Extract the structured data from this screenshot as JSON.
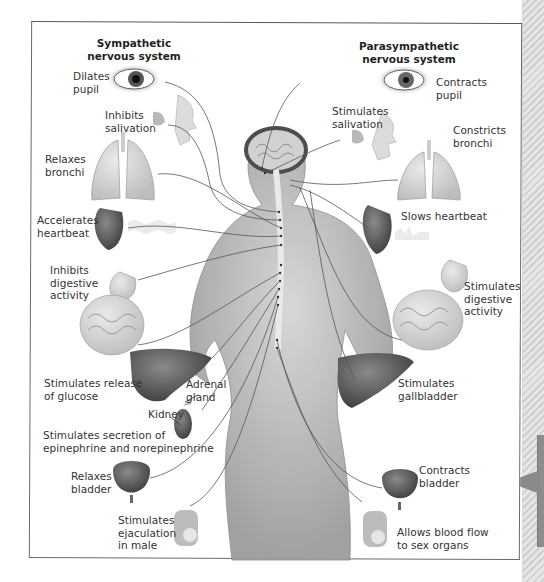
{
  "diagram": {
    "type": "autonomic-nervous-system-illustration",
    "headers": {
      "sympathetic": "Sympathetic\nnervous system",
      "parasympathetic": "Parasympathetic\nnervous system"
    },
    "sympathetic_effects": [
      {
        "organ": "eye",
        "label": "Dilates\npupil"
      },
      {
        "organ": "salivary-gland",
        "label": "Inhibits\nsalivation"
      },
      {
        "organ": "lungs",
        "label": "Relaxes\nbronchi"
      },
      {
        "organ": "heart",
        "label": "Accelerates\nheartbeat"
      },
      {
        "organ": "stomach-intestines",
        "label": "Inhibits\ndigestive\nactivity"
      },
      {
        "organ": "liver",
        "label": "Stimulates release\nof glucose"
      },
      {
        "organ": "adrenal-gland",
        "label": "Adrenal\ngland"
      },
      {
        "organ": "kidney",
        "label": "Kidney"
      },
      {
        "organ": "adrenal-secretion",
        "label": "Stimulates secretion of\nepinephrine and norepinephrine"
      },
      {
        "organ": "bladder",
        "label": "Relaxes\nbladder"
      },
      {
        "organ": "sex-organs",
        "label": "Stimulates\nejaculation\nin male"
      }
    ],
    "parasympathetic_effects": [
      {
        "organ": "eye",
        "label": "Contracts\npupil"
      },
      {
        "organ": "salivary-gland",
        "label": "Stimulates\nsalivation"
      },
      {
        "organ": "lungs",
        "label": "Constricts\nbronchi"
      },
      {
        "organ": "heart",
        "label": "Slows heartbeat"
      },
      {
        "organ": "stomach-intestines",
        "label": "Stimulates\ndigestive\nactivity"
      },
      {
        "organ": "liver",
        "label": "Stimulates\ngallbladder"
      },
      {
        "organ": "bladder",
        "label": "Contracts\nbladder"
      },
      {
        "organ": "sex-organs",
        "label": "Allows blood flow\nto sex organs"
      }
    ]
  },
  "colors": {
    "frame": "#6a6a6a",
    "nerve_line": "#555555",
    "skin": "#b8b8b8",
    "organ_dark": "#5a5a5a",
    "organ_light": "#d8d8d8",
    "side_tab": "#8d8d8d"
  }
}
